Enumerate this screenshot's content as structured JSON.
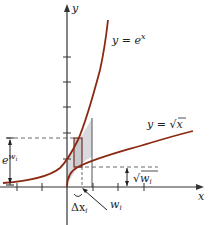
{
  "figure": {
    "axes": {
      "x_label": "x",
      "y_label": "y"
    },
    "curves": [
      {
        "name": "exp",
        "label": "y = e",
        "label_sup": "x",
        "color": "#8b2a12"
      },
      {
        "name": "sqrt",
        "label": "y = ",
        "label_rad": "x",
        "color": "#8b2a12"
      }
    ],
    "annotations": {
      "e_w_base": "e",
      "e_w_sup": "w",
      "e_w_sub": "i",
      "sqrt_w": "w",
      "sqrt_w_sub": "i",
      "delta_x": "Δx",
      "delta_x_sub": "i",
      "w_label": "w",
      "w_label_sub": "i"
    },
    "shading_color": "#d9d9de"
  }
}
